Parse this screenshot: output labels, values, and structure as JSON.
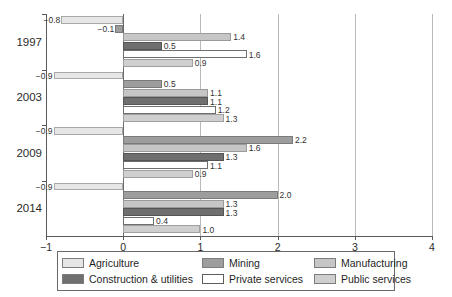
{
  "chart_data": {
    "type": "bar",
    "orientation": "horizontal",
    "title": "",
    "subtitle": "",
    "xlabel": "",
    "ylabel": "",
    "xlim": [
      -1,
      4
    ],
    "ylim": null,
    "grid": true,
    "xticks": [
      "-1",
      "0",
      "1",
      "2",
      "3",
      "4"
    ],
    "xtick_values": [
      -1,
      0,
      1,
      2,
      3,
      4
    ],
    "categories": [
      "1997",
      "2003",
      "2009",
      "2014"
    ],
    "legend_position": "bottom",
    "series": [
      {
        "name": "Agriculture",
        "color": "#e6e6e6",
        "values": [
          -0.8,
          -0.9,
          -0.9,
          -0.9
        ],
        "labels": [
          "-0.8",
          "-0.9",
          "-0.9",
          "-0.9"
        ]
      },
      {
        "name": "Mining",
        "color": "#9d9d9d",
        "values": [
          -0.1,
          0.5,
          2.2,
          2.0
        ],
        "labels": [
          "-0.1",
          "0.5",
          "2.2",
          "2.0"
        ]
      },
      {
        "name": "Manufacturing",
        "color": "#c6c6c6",
        "values": [
          1.4,
          1.1,
          1.6,
          1.3
        ],
        "labels": [
          "1.4",
          "1.1",
          "1.6",
          "1.3"
        ]
      },
      {
        "name": "Construction & utilities",
        "color": "#6f6f6f",
        "values": [
          0.5,
          1.1,
          1.3,
          1.3
        ],
        "labels": [
          "0.5",
          "1.1",
          "1.3",
          "1.3"
        ]
      },
      {
        "name": "Private services",
        "color": "#ffffff",
        "values": [
          1.6,
          1.2,
          1.1,
          0.4
        ],
        "labels": [
          "1.6",
          "1.2",
          "1.1",
          "0.4"
        ]
      },
      {
        "name": "Public services",
        "color": "#cfcfcf",
        "values": [
          0.9,
          1.3,
          0.9,
          1.0
        ],
        "labels": [
          "0.9",
          "1.3",
          "0.9",
          "1.0"
        ]
      }
    ]
  },
  "legend": {
    "entries": [
      {
        "label": "Agriculture",
        "key": "agriculture"
      },
      {
        "label": "Mining",
        "key": "mining"
      },
      {
        "label": "Manufacturing",
        "key": "manufacturing"
      },
      {
        "label": "Construction & utilities",
        "key": "construction"
      },
      {
        "label": "Private services",
        "key": "private"
      },
      {
        "label": "Public services",
        "key": "public"
      }
    ]
  }
}
